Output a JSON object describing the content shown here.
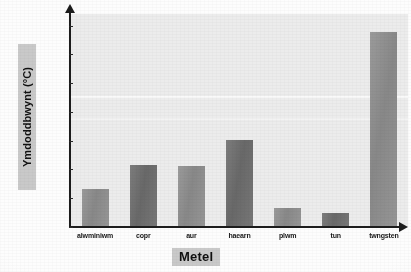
{
  "chart_data": {
    "type": "bar",
    "title": "",
    "subtitle": "",
    "xlabel": "Metel",
    "ylabel": "Ymdoddbwynt (°C)",
    "categories": [
      "alwminiwm",
      "copr",
      "aur",
      "haearn",
      "plwm",
      "tun",
      "twngsten"
    ],
    "values": [
      660,
      1085,
      1065,
      1520,
      330,
      235,
      3390
    ],
    "series": [
      {
        "name": "Ymdoddbwynt",
        "values": [
          660,
          1085,
          1065,
          1520,
          330,
          235,
          3390
        ]
      }
    ],
    "ylim": [
      0,
      3700
    ],
    "yticks": [
      0,
      500,
      1000,
      1500,
      2000,
      2500,
      3000,
      3500
    ],
    "ytick_labels": [
      "0",
      "500",
      "1000",
      "1500",
      "2000",
      "2500",
      "3000",
      "3500"
    ],
    "xlim_categories": 7,
    "grid": false,
    "legend": false,
    "legend_position": "none",
    "bar_shades": [
      "light",
      "dark",
      "light",
      "dark",
      "light",
      "dark",
      "light"
    ],
    "colors": {
      "bar_light": "#8f8f8f",
      "bar_dark": "#6e6e6e",
      "plot_background": "#ececec",
      "page_background": "#fdfdfd",
      "axis": "#1c1c1c",
      "label_highlight": "#c9c9c9",
      "text": "#101010"
    }
  }
}
